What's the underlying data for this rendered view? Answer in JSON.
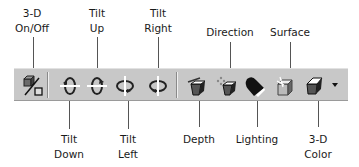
{
  "toolbar": {
    "name": "3-D Settings",
    "buttons": [
      {
        "id": "on-off",
        "label_line1": "3-D",
        "label_line2": "On/Off",
        "position": "top"
      },
      {
        "id": "tilt-down",
        "label_line1": "Tilt",
        "label_line2": "Down",
        "position": "bottom"
      },
      {
        "id": "tilt-up",
        "label_line1": "Tilt",
        "label_line2": "Up",
        "position": "top"
      },
      {
        "id": "tilt-left",
        "label_line1": "Tilt",
        "label_line2": "Left",
        "position": "bottom"
      },
      {
        "id": "tilt-right",
        "label_line1": "Tilt",
        "label_line2": "Right",
        "position": "top"
      },
      {
        "id": "depth",
        "label_line1": "Depth",
        "label_line2": "",
        "position": "bottom"
      },
      {
        "id": "direction",
        "label_line1": "Direction",
        "label_line2": "",
        "position": "top"
      },
      {
        "id": "lighting",
        "label_line1": "Lighting",
        "label_line2": "",
        "position": "bottom"
      },
      {
        "id": "surface",
        "label_line1": "Surface",
        "label_line2": "",
        "position": "top"
      },
      {
        "id": "color",
        "label_line1": "3-D",
        "label_line2": "Color",
        "position": "bottom"
      }
    ]
  },
  "colors": {
    "toolbar_bg": "#c8c8c8",
    "text": "#1a1a1a",
    "leader": "#555555"
  }
}
